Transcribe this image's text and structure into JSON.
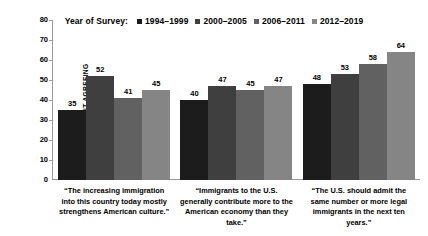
{
  "chart_data": {
    "type": "bar",
    "title": "",
    "subtitle": "",
    "legend_title": "Year of Survey:",
    "legend_position": "top-center",
    "xlabel": "",
    "ylabel": "PERCENT AGREEING",
    "ylim": [
      0,
      80
    ],
    "ytick_labels": [
      "80",
      "70",
      "60",
      "50",
      "40",
      "30",
      "20",
      "10",
      "0"
    ],
    "ytick_values": [
      80,
      70,
      60,
      50,
      40,
      30,
      20,
      10,
      0
    ],
    "grid": false,
    "categories": [
      "“The increasing immigration into this country today mostly strengthens American culture.”",
      "“Immigrants to the U.S. generally contribute more to the American economy than they take.”",
      "“The U.S. should admit the same number or more legal immigrants in the next ten years.”"
    ],
    "series": [
      {
        "name": "1994–1999",
        "color": "#1c1c1c",
        "values": [
          35,
          40,
          48
        ]
      },
      {
        "name": "2000–2005",
        "color": "#3f3f3f",
        "values": [
          52,
          47,
          53
        ]
      },
      {
        "name": "2006–2011",
        "color": "#616161",
        "values": [
          41,
          45,
          58
        ]
      },
      {
        "name": "2012–2019",
        "color": "#858585",
        "values": [
          45,
          47,
          64
        ]
      }
    ]
  },
  "axis": {
    "line_color": "#9a9a9a"
  },
  "background": "#ffffff"
}
